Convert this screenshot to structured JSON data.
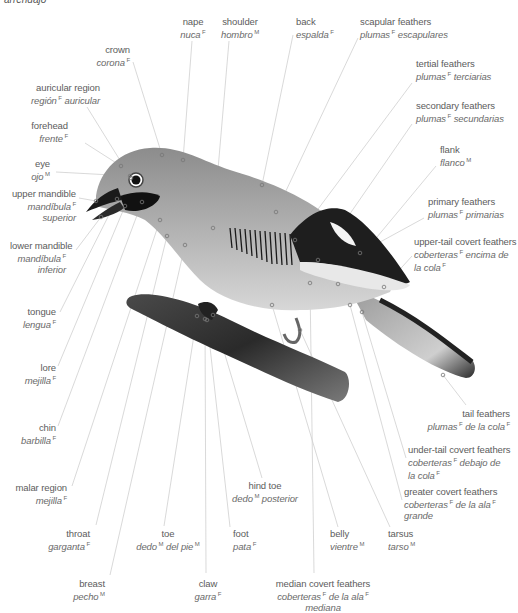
{
  "title": "arrendajo",
  "labels": [
    {
      "id": "nape",
      "en": "nape",
      "es": "nuca",
      "g1": "F",
      "x": 163,
      "y": 16,
      "w": 60,
      "align": "c",
      "px": 183,
      "py": 160,
      "lx": 192,
      "ly": 41
    },
    {
      "id": "shoulder",
      "en": "shoulder",
      "es": "hombro",
      "g1": "M",
      "x": 210,
      "y": 16,
      "w": 60,
      "align": "c",
      "px": 213,
      "py": 228,
      "lx": 229,
      "ly": 41
    },
    {
      "id": "crown",
      "en": "crown",
      "es": "corona",
      "g1": "F",
      "x": 90,
      "y": 44,
      "w": 40,
      "align": "r",
      "px": 162,
      "py": 155,
      "lx": 133,
      "ly": 62
    },
    {
      "id": "back",
      "en": "back",
      "es": "espalda",
      "g1": "F",
      "x": 296,
      "y": 16,
      "w": 60,
      "align": "l",
      "px": 262,
      "py": 185,
      "lx": 293,
      "ly": 35
    },
    {
      "id": "scapular",
      "en": "scapular feathers",
      "es": "plumas",
      "g1": "F",
      "es2": "escapulares",
      "x": 360,
      "y": 16,
      "w": 120,
      "align": "l",
      "px": 276,
      "py": 212,
      "lx": 358,
      "ly": 38
    },
    {
      "id": "tertial",
      "en": "tertial feathers",
      "es": "plumas",
      "g1": "F",
      "es2": "terciarias",
      "x": 416,
      "y": 58,
      "w": 100,
      "align": "l",
      "px": 295,
      "py": 240,
      "lx": 412,
      "ly": 83
    },
    {
      "id": "auricular",
      "en": "auricular region",
      "es": "región",
      "g1": "F",
      "es2": "auricular",
      "x": 20,
      "y": 82,
      "w": 80,
      "align": "r",
      "px": 131,
      "py": 178,
      "lx": 87,
      "ly": 107
    },
    {
      "id": "secondary",
      "en": "secondary feathers",
      "es": "plumas",
      "g1": "F",
      "es2": "secundarias",
      "x": 416,
      "y": 100,
      "w": 100,
      "align": "l",
      "px": 318,
      "py": 260,
      "lx": 412,
      "ly": 124
    },
    {
      "id": "forehead",
      "en": "forehead",
      "es": "frente",
      "g1": "F",
      "x": 28,
      "y": 120,
      "w": 40,
      "align": "r",
      "px": 121,
      "py": 166,
      "lx": 85,
      "ly": 143
    },
    {
      "id": "flank",
      "en": "flank",
      "es": "flanco",
      "g1": "M",
      "x": 440,
      "y": 144,
      "w": 60,
      "align": "l",
      "px": 338,
      "py": 284,
      "lx": 436,
      "ly": 166
    },
    {
      "id": "eye",
      "en": "eye",
      "es": "ojo",
      "g1": "M",
      "x": 10,
      "y": 158,
      "w": 40,
      "align": "r",
      "px": 130,
      "py": 176,
      "lx": 56,
      "ly": 172
    },
    {
      "id": "upper_mandible",
      "en": "upper mandible",
      "es": "mandíbula",
      "g1": "F",
      "es2": "superior",
      "x": 10,
      "y": 188,
      "w": 66,
      "align": "r",
      "px": 96,
      "py": 201,
      "lx": 79,
      "ly": 198
    },
    {
      "id": "primary",
      "en": "primary feathers",
      "es": "plumas",
      "g1": "F",
      "es2": "primarias",
      "x": 428,
      "y": 196,
      "w": 90,
      "align": "l",
      "px": 360,
      "py": 253,
      "lx": 424,
      "ly": 218
    },
    {
      "id": "upper_tail",
      "en": "upper-tail covert feathers",
      "es": "coberteras",
      "g1": "F",
      "es2": "encima de",
      "es3": "la cola",
      "g3": "F",
      "x": 414,
      "y": 236,
      "w": 100,
      "align": "l",
      "px": 384,
      "py": 287,
      "lx": 412,
      "ly": 256
    },
    {
      "id": "lower_mandible",
      "en": "lower mandible",
      "es": "mandíbula",
      "g1": "F",
      "es2": "inferior",
      "x": 10,
      "y": 240,
      "w": 56,
      "align": "r",
      "px": 101,
      "py": 217,
      "lx": 76,
      "ly": 250
    },
    {
      "id": "tongue",
      "en": "tongue",
      "es": "lengua",
      "g1": "F",
      "x": 12,
      "y": 306,
      "w": 44,
      "align": "r",
      "px": 117,
      "py": 199,
      "lx": 60,
      "ly": 312
    },
    {
      "id": "lore",
      "en": "lore",
      "es": "mejilla",
      "g1": "F",
      "x": 12,
      "y": 362,
      "w": 44,
      "align": "r",
      "px": 125,
      "py": 206,
      "lx": 58,
      "ly": 366
    },
    {
      "id": "chin",
      "en": "chin",
      "es": "barbilla",
      "g1": "F",
      "x": 12,
      "y": 422,
      "w": 44,
      "align": "r",
      "px": 142,
      "py": 202,
      "lx": 58,
      "ly": 426
    },
    {
      "id": "tail",
      "en": "tail feathers",
      "es": "plumas",
      "g1": "F",
      "es2": "de la cola",
      "g2": "F",
      "x": 420,
      "y": 408,
      "w": 90,
      "align": "r",
      "px": 443,
      "py": 375,
      "lx": 466,
      "ly": 405
    },
    {
      "id": "under_tail",
      "en": "under-tail covert feathers",
      "es": "coberteras",
      "g1": "F",
      "es2": "debajo de",
      "es3": "la cola",
      "g3": "F",
      "x": 408,
      "y": 444,
      "w": 104,
      "align": "l",
      "px": 362,
      "py": 312,
      "lx": 406,
      "ly": 458
    },
    {
      "id": "malar",
      "en": "malar region",
      "es": "mejilla",
      "g1": "F",
      "x": 12,
      "y": 482,
      "w": 55,
      "align": "r",
      "px": 160,
      "py": 220,
      "lx": 72,
      "ly": 486
    },
    {
      "id": "greater_covert",
      "en": "greater covert feathers",
      "es": "coberteras",
      "g1": "F",
      "es2": "de la ala",
      "g2": "F",
      "es3": "grande",
      "x": 404,
      "y": 486,
      "w": 104,
      "align": "l",
      "px": 350,
      "py": 305,
      "lx": 402,
      "ly": 500
    },
    {
      "id": "hind_toe",
      "en": "hind toe",
      "es": "dedo",
      "g1": "M",
      "es2": "posterior",
      "x": 220,
      "y": 480,
      "w": 90,
      "align": "c",
      "px": 213,
      "py": 315,
      "lx": 262,
      "ly": 478
    },
    {
      "id": "foot",
      "en": "foot",
      "es": "pata",
      "g1": "F",
      "x": 233,
      "y": 528,
      "w": 40,
      "align": "l",
      "px": 207,
      "py": 320,
      "lx": 230,
      "ly": 527
    },
    {
      "id": "belly",
      "en": "belly",
      "es": "vientre",
      "g1": "M",
      "x": 330,
      "y": 528,
      "w": 50,
      "align": "l",
      "px": 272,
      "py": 305,
      "lx": 338,
      "ly": 527
    },
    {
      "id": "tarsus",
      "en": "tarsus",
      "es": "tarso",
      "g1": "M",
      "x": 388,
      "y": 528,
      "w": 40,
      "align": "l",
      "px": 300,
      "py": 330,
      "lx": 390,
      "ly": 527
    },
    {
      "id": "throat",
      "en": "throat",
      "es": "garganta",
      "g1": "F",
      "x": 40,
      "y": 528,
      "w": 50,
      "align": "r",
      "px": 167,
      "py": 236,
      "lx": 96,
      "ly": 525
    },
    {
      "id": "toe",
      "en": "toe",
      "es": "dedo",
      "g1": "M",
      "es2": "del pie",
      "g2": "M",
      "x": 128,
      "y": 528,
      "w": 80,
      "align": "c",
      "px": 197,
      "py": 316,
      "lx": 164,
      "ly": 526
    },
    {
      "id": "breast",
      "en": "breast",
      "es": "pecho",
      "g1": "M",
      "x": 50,
      "y": 578,
      "w": 55,
      "align": "r",
      "px": 185,
      "py": 245,
      "lx": 110,
      "ly": 575
    },
    {
      "id": "claw",
      "en": "claw",
      "es": "garra",
      "g1": "F",
      "x": 188,
      "y": 578,
      "w": 40,
      "align": "c",
      "px": 205,
      "py": 319,
      "lx": 206,
      "ly": 573
    },
    {
      "id": "median_covert",
      "en": "median covert feathers",
      "es": "coberteras",
      "g1": "F",
      "es2": "de la ala",
      "g2": "F",
      "es3": "mediana",
      "x": 258,
      "y": 578,
      "w": 130,
      "align": "c",
      "px": 310,
      "py": 283,
      "lx": 314,
      "ly": 573
    }
  ],
  "colors": {
    "leader": "#cfcfcf",
    "dot": "#777777",
    "text": "#5c5c5c"
  }
}
